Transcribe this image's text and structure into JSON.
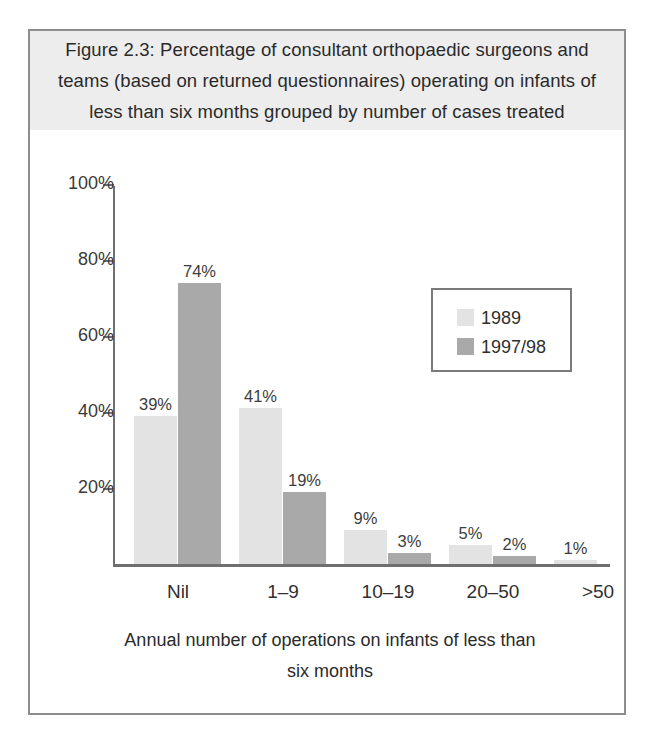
{
  "figure": {
    "title": "Figure 2.3: Percentage of consultant orthopaedic surgeons and teams (based on returned questionnaires) operating on infants of less than six months grouped by number of cases treated",
    "border_color": "#8d8d8d",
    "title_band_color": "#ededed"
  },
  "chart_data": {
    "type": "bar",
    "title": "Figure 2.3: Percentage of consultant orthopaedic surgeons and teams (based on returned questionnaires) operating on infants of less than six months grouped by number of cases treated",
    "xlabel": "Annual number of operations on infants of less than six months",
    "ylabel": "",
    "categories": [
      "Nil",
      "1–9",
      "10–19",
      "20–50",
      ">50"
    ],
    "series": [
      {
        "name": "1989",
        "color": "#e3e3e3",
        "values": [
          39,
          41,
          9,
          5,
          1
        ],
        "labels": [
          "39%",
          "41%",
          "9%",
          "5%",
          "1%"
        ]
      },
      {
        "name": "1997/98",
        "color": "#a9a9a9",
        "values": [
          74,
          19,
          3,
          2,
          null
        ],
        "labels": [
          "74%",
          "19%",
          "3%",
          "2%",
          ""
        ]
      }
    ],
    "ylim": [
      0,
      100
    ],
    "yticks": [
      100,
      80,
      60,
      40,
      20
    ],
    "ytick_labels": [
      "100%",
      "80%",
      "60%",
      "40%",
      "20%"
    ],
    "grid": false,
    "legend_position": "upper right",
    "axis_color": "#6f6f6f"
  },
  "axis": {
    "caption_line_1": "Annual number of operations on infants of less than",
    "caption_line_2": "six months"
  }
}
